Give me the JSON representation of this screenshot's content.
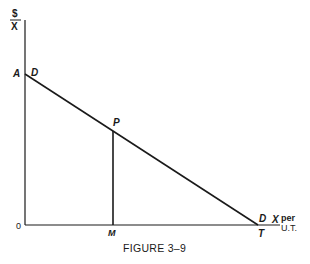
{
  "figure": {
    "caption": "FIGURE 3–9",
    "y_axis_label_top": "$",
    "y_axis_label_bottom": "X",
    "x_axis_label_main": "X",
    "x_axis_label_per": "per",
    "x_axis_label_unit": "U.T.",
    "origin_label": "0",
    "points": {
      "A": "A",
      "D_top": "D",
      "P": "P",
      "M": "M",
      "D_bottom": "D",
      "T": "T"
    }
  },
  "colors": {
    "ink": "#1a1a1a",
    "background": "#ffffff"
  }
}
